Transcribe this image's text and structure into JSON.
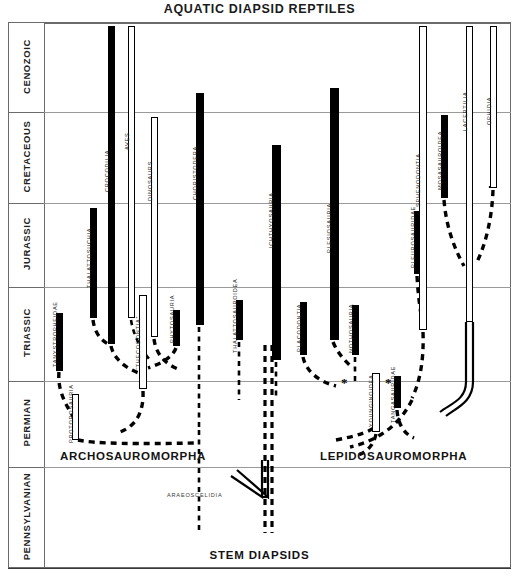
{
  "title": "AQUATIC DIAPSID REPTILES",
  "colors": {
    "bar_fill": "#000000",
    "frame": "#6b6b6b",
    "gridline": "#9a9a9a",
    "background": "#ffffff",
    "text": "#1a1a1a"
  },
  "time_scale": {
    "periods": [
      {
        "name": "CENOZOIC",
        "top": 23,
        "bottom": 112
      },
      {
        "name": "CRETACEOUS",
        "top": 112,
        "bottom": 203
      },
      {
        "name": "JURASSIC",
        "top": 203,
        "bottom": 287
      },
      {
        "name": "TRIASSIC",
        "top": 287,
        "bottom": 381
      },
      {
        "name": "PERMIAN",
        "top": 381,
        "bottom": 467
      },
      {
        "name": "PENNSYLVANIAN",
        "top": 467,
        "bottom": 568
      }
    ]
  },
  "clades": [
    {
      "label": "ARCHOSAUROMORPHA",
      "x": 60,
      "y": 450
    },
    {
      "label": "LEPIDOSAUROMORPHA",
      "x": 320,
      "y": 450
    },
    {
      "label": "STEM DIAPSIDS",
      "x": 0,
      "y": 549
    },
    {
      "label": "ARAEOSCELIDIA",
      "x": 167,
      "y": 492
    }
  ],
  "taxa": [
    {
      "name": "TANYSTROPHEIDAE",
      "style": "solid",
      "x": 56,
      "top": 313,
      "bottom": 371,
      "width": 7,
      "label_x": 55,
      "label_y": 367
    },
    {
      "name": "PROTOROSAURIA",
      "style": "hollow",
      "x": 72,
      "top": 394,
      "bottom": 440,
      "width": 7,
      "label_x": 71,
      "label_y": 443
    },
    {
      "name": "THALATTOSUCHIA",
      "style": "solid",
      "x": 90,
      "top": 208,
      "bottom": 318,
      "width": 7,
      "label_x": 89,
      "label_y": 288
    },
    {
      "name": "CROCODILIA",
      "style": "solid",
      "x": 108,
      "top": 26,
      "bottom": 344,
      "width": 7,
      "label_x": 107,
      "label_y": 192
    },
    {
      "name": "AVES",
      "style": "hollow",
      "x": 128,
      "top": 26,
      "bottom": 318,
      "width": 7,
      "label_x": 127,
      "label_y": 150
    },
    {
      "name": "DINOSAURS",
      "style": "hollow",
      "x": 151,
      "top": 117,
      "bottom": 337,
      "width": 7,
      "label_x": 150,
      "label_y": 201
    },
    {
      "name": "“THECODONTIA”",
      "style": "hollow",
      "x": 139,
      "top": 295,
      "bottom": 389,
      "width": 8,
      "label_x": 138,
      "label_y": 370
    },
    {
      "name": "PHYTOSAURIA",
      "style": "solid",
      "x": 173,
      "top": 310,
      "bottom": 346,
      "width": 7,
      "label_x": 172,
      "label_y": 343
    },
    {
      "name": "CHORISTODERA",
      "style": "solid",
      "x": 196,
      "top": 93,
      "bottom": 325,
      "width": 8,
      "label_x": 195,
      "label_y": 200
    },
    {
      "name": "THALATTOSAUROIDEA",
      "style": "solid",
      "x": 236,
      "top": 300,
      "bottom": 340,
      "width": 7,
      "label_x": 235,
      "label_y": 353
    },
    {
      "name": "ICHTHYOSAURIA",
      "style": "solid",
      "x": 272,
      "top": 145,
      "bottom": 360,
      "width": 9,
      "label_x": 271,
      "label_y": 248
    },
    {
      "name": "PLACODONTIA",
      "style": "solid",
      "x": 300,
      "top": 302,
      "bottom": 355,
      "width": 7,
      "label_x": 299,
      "label_y": 352
    },
    {
      "name": "PLESIOSAURIA",
      "style": "solid",
      "x": 330,
      "top": 88,
      "bottom": 340,
      "width": 9,
      "label_x": 329,
      "label_y": 253
    },
    {
      "name": "NOTHOSAURIA",
      "style": "solid",
      "x": 352,
      "top": 305,
      "bottom": 355,
      "width": 7,
      "label_x": 351,
      "label_y": 353
    },
    {
      "name": "YOUNGINOIDEA",
      "style": "hollow",
      "x": 372,
      "top": 373,
      "bottom": 432,
      "width": 8,
      "label_x": 371,
      "label_y": 427
    },
    {
      "name": "TANGASAURIDAE",
      "style": "solid",
      "x": 394,
      "top": 376,
      "bottom": 408,
      "width": 7,
      "label_x": 393,
      "label_y": 423
    },
    {
      "name": "PLEUROSAURIDAE",
      "style": "solid",
      "x": 414,
      "top": 211,
      "bottom": 274,
      "width": 7,
      "label_x": 413,
      "label_y": 268
    },
    {
      "name": "SPHENODONTIA",
      "style": "hollow",
      "x": 419,
      "top": 26,
      "bottom": 330,
      "width": 8,
      "label_x": 418,
      "label_y": 207
    },
    {
      "name": "MOSASAUROIDEA",
      "style": "solid",
      "x": 441,
      "top": 115,
      "bottom": 198,
      "width": 7,
      "label_x": 440,
      "label_y": 190
    },
    {
      "name": "LACERTILIA",
      "style": "hollow",
      "x": 466,
      "top": 26,
      "bottom": 322,
      "width": 7,
      "label_x": 465,
      "label_y": 131
    },
    {
      "name": "OPHIDIA",
      "style": "hollow",
      "x": 490,
      "top": 26,
      "bottom": 188,
      "width": 7,
      "label_x": 489,
      "label_y": 125
    }
  ],
  "annotations": [
    {
      "symbol": "*",
      "x": 341,
      "y": 376
    },
    {
      "symbol": "*",
      "x": 385,
      "y": 376
    }
  ]
}
